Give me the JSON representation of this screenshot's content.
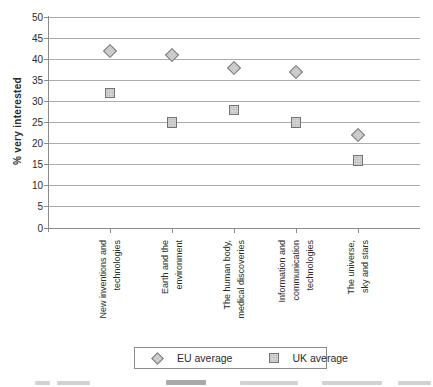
{
  "chart_data": {
    "type": "scatter",
    "title": "",
    "categories": [
      "New inventions and technologies",
      "Earth and the environment",
      "The human body, medical discoveries",
      "Information and communication technologies",
      "The universe, sky and stars"
    ],
    "category_label_lines": [
      [
        "New inventions and",
        "technologies"
      ],
      [
        "Earth and the",
        "environment"
      ],
      [
        "The human body,",
        "medical discoveries"
      ],
      [
        "Information and",
        "communication",
        "technologies"
      ],
      [
        "The universe,",
        "sky and stars"
      ]
    ],
    "series": [
      {
        "name": "EU average",
        "marker": "diamond",
        "values": [
          42,
          41,
          38,
          37,
          22
        ]
      },
      {
        "name": "UK average",
        "marker": "square",
        "values": [
          32,
          25,
          28,
          25,
          16
        ]
      }
    ],
    "xlabel": "",
    "ylabel": "% very interested",
    "ylim": [
      0,
      50
    ],
    "ytick_step": 5,
    "yticks": [
      0,
      5,
      10,
      15,
      20,
      25,
      30,
      35,
      40,
      45,
      50
    ],
    "grid": true,
    "legend_position": "bottom-center",
    "colors": {
      "marker_fill": "#d6d6d6",
      "marker_border": "#737373",
      "gridline": "#ababab",
      "axis": "#8c8c8c",
      "text": "#2b2b2b"
    }
  }
}
